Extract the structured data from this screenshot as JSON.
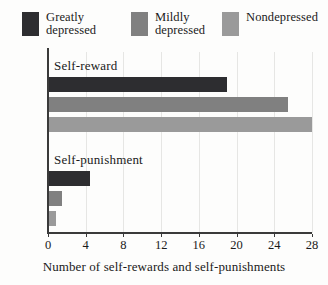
{
  "chart_data": {
    "type": "bar",
    "orientation": "horizontal",
    "title": "",
    "xlabel": "Number of self-rewards and self-punishments",
    "ylabel": "",
    "xlim": [
      0,
      28
    ],
    "xticks": [
      0,
      4,
      8,
      12,
      16,
      20,
      24,
      28
    ],
    "xtick_labels": [
      "0",
      "4",
      "8",
      "12",
      "16",
      "20",
      "24",
      "28"
    ],
    "grid": true,
    "grid_axis": "x",
    "legend_position": "top",
    "categories": [
      "Self-reward",
      "Self-punishment"
    ],
    "series": [
      {
        "name": "Greatly depressed",
        "color": "#2d2d30",
        "values": [
          19.0,
          4.5
        ]
      },
      {
        "name": "Mildly depressed",
        "color": "#808080",
        "values": [
          25.5,
          1.5
        ]
      },
      {
        "name": "Nondepressed",
        "color": "#9a9a9a",
        "values": [
          28.0,
          0.8
        ]
      }
    ]
  },
  "legend": {
    "items": [
      {
        "label": "Greatly\ndepressed",
        "color": "#2d2d30"
      },
      {
        "label": "Mildly\ndepressed",
        "color": "#808080"
      },
      {
        "label": "Nondepressed",
        "color": "#9a9a9a"
      }
    ]
  },
  "axis": {
    "x_title": "Number of self-rewards and self-punishments",
    "tick_labels": [
      "0",
      "4",
      "8",
      "12",
      "16",
      "20",
      "24",
      "28"
    ]
  },
  "groups": [
    {
      "label": "Self-reward"
    },
    {
      "label": "Self-punishment"
    }
  ],
  "colors": {
    "greatly_depressed": "#2d2d30",
    "mildly_depressed": "#808080",
    "nondepressed": "#9a9a9a",
    "axis": "#3a3a3a",
    "gridline": "#e6e6e4",
    "background": "#fdfdfc",
    "text": "#1a1a1a"
  }
}
